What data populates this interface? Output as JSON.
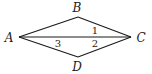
{
  "figure": {
    "vertices": [
      {
        "id": "A",
        "label": "A",
        "x": 19,
        "y": 37,
        "label_x": 9,
        "label_y": 42
      },
      {
        "id": "B",
        "label": "B",
        "x": 78,
        "y": 17,
        "label_x": 77,
        "label_y": 12
      },
      {
        "id": "C",
        "label": "C",
        "x": 131,
        "y": 37,
        "label_x": 141,
        "label_y": 42
      },
      {
        "id": "D",
        "label": "D",
        "x": 78,
        "y": 57,
        "label_x": 77,
        "label_y": 71
      }
    ],
    "segments": [
      {
        "from": "A",
        "to": "B"
      },
      {
        "from": "B",
        "to": "C"
      },
      {
        "from": "C",
        "to": "D"
      },
      {
        "from": "D",
        "to": "A"
      },
      {
        "from": "A",
        "to": "C"
      }
    ],
    "angle_labels": [
      {
        "label": "1",
        "x": 95,
        "y": 34,
        "at_vertex": "C",
        "between": "BC-AC"
      },
      {
        "label": "2",
        "x": 95,
        "y": 47,
        "at_vertex": "C",
        "between": "AC-DC"
      },
      {
        "label": "3",
        "x": 58,
        "y": 47,
        "at_vertex": "A",
        "between": "AC-AD"
      }
    ]
  }
}
